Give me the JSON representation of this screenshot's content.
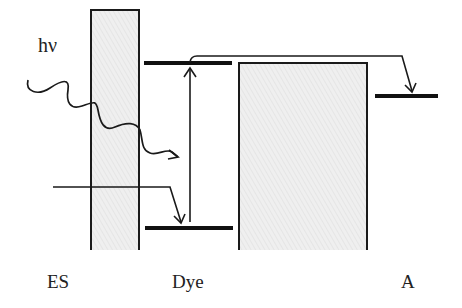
{
  "diagram": {
    "labels": {
      "photon": "hν",
      "es": "ES",
      "dye": "Dye",
      "acceptor": "A"
    },
    "colors": {
      "line": "#1a1a1a",
      "fill": "#eeeeee",
      "hatch": "#d6d6d6",
      "text": "#222222",
      "background": "#ffffff"
    },
    "components": [
      {
        "id": "es-band",
        "label": "ES",
        "type": "band"
      },
      {
        "id": "dye-lumo",
        "label": "Dye LUMO",
        "type": "level"
      },
      {
        "id": "dye-homo",
        "label": "Dye HOMO",
        "type": "level"
      },
      {
        "id": "middle-band",
        "label": "",
        "type": "band"
      },
      {
        "id": "acceptor-level",
        "label": "A",
        "type": "level"
      }
    ],
    "arrows": [
      {
        "id": "photon-arrow",
        "kind": "wavy",
        "from": "hν",
        "to": "Dye"
      },
      {
        "id": "es-to-homo",
        "from": "ES",
        "to": "Dye HOMO"
      },
      {
        "id": "excitation",
        "from": "Dye HOMO",
        "to": "Dye LUMO"
      },
      {
        "id": "lumo-to-acceptor",
        "from": "Dye LUMO",
        "to": "A"
      }
    ]
  }
}
